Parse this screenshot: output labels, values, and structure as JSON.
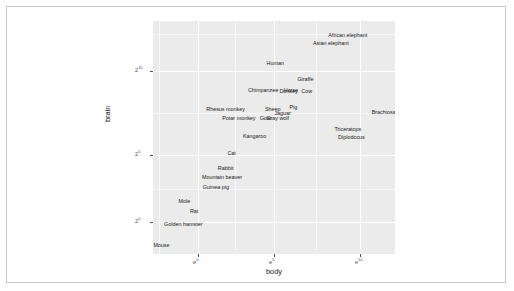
{
  "chart_data": {
    "type": "scatter",
    "title": "",
    "xlabel": "body",
    "ylabel": "brain",
    "x_scale": "log-e",
    "y_scale": "log-2",
    "grid": true,
    "legend": "none",
    "x_ticks": [
      {
        "label_base": "e",
        "label_exp": "0",
        "pos_pct": 18.6
      },
      {
        "label_base": "e",
        "label_exp": "5",
        "pos_pct": 50.0
      },
      {
        "label_base": "e",
        "label_exp": "10",
        "pos_pct": 85.5
      }
    ],
    "y_ticks": [
      {
        "label_base": "2",
        "label_exp": "10",
        "pos_pct": 21.5
      },
      {
        "label_base": "2",
        "label_exp": "5",
        "pos_pct": 57.5
      },
      {
        "label_base": "2",
        "label_exp": "0",
        "pos_pct": 86.3
      }
    ],
    "x_gridlines_major_pct": [
      18.6,
      50.0,
      85.5
    ],
    "y_gridlines_major_pct": [
      21.5,
      57.5,
      86.3
    ],
    "x_gridlines_minor_pct": [
      2.5,
      34.0,
      67.5
    ],
    "y_gridlines_minor_pct": [
      5.5,
      39.5,
      72.0
    ],
    "points": [
      {
        "name": "African elephant",
        "x_pct": 80.5,
        "y_pct": 6.5
      },
      {
        "name": "Asian elephant",
        "x_pct": 73.5,
        "y_pct": 10.0
      },
      {
        "name": "Human",
        "x_pct": 50.5,
        "y_pct": 18.5
      },
      {
        "name": "Giraffe",
        "x_pct": 63.0,
        "y_pct": 25.5
      },
      {
        "name": "Chimpanzee",
        "x_pct": 45.5,
        "y_pct": 30.0
      },
      {
        "name": "Horse",
        "x_pct": 57.0,
        "y_pct": 30.0
      },
      {
        "name": "Donkey",
        "x_pct": 56.0,
        "y_pct": 30.5
      },
      {
        "name": "Cow",
        "x_pct": 63.5,
        "y_pct": 30.3
      },
      {
        "name": "Rhesus monkey",
        "x_pct": 30.0,
        "y_pct": 38.0
      },
      {
        "name": "Sheep",
        "x_pct": 49.5,
        "y_pct": 38.0
      },
      {
        "name": "Pig",
        "x_pct": 58.0,
        "y_pct": 37.5
      },
      {
        "name": "Jaguar",
        "x_pct": 53.5,
        "y_pct": 39.8
      },
      {
        "name": "Potar monkey",
        "x_pct": 35.5,
        "y_pct": 42.0
      },
      {
        "name": "Goat",
        "x_pct": 46.5,
        "y_pct": 42.0
      },
      {
        "name": "Gray wolf",
        "x_pct": 51.5,
        "y_pct": 42.0
      },
      {
        "name": "Brachiosaurus",
        "x_pct": 97.5,
        "y_pct": 39.5
      },
      {
        "name": "Triceratops",
        "x_pct": 80.5,
        "y_pct": 46.8
      },
      {
        "name": "Diplodocus",
        "x_pct": 82.0,
        "y_pct": 50.2
      },
      {
        "name": "Kangaroo",
        "x_pct": 42.0,
        "y_pct": 49.8
      },
      {
        "name": "Cat",
        "x_pct": 32.5,
        "y_pct": 57.0
      },
      {
        "name": "Rabbit",
        "x_pct": 30.0,
        "y_pct": 63.5
      },
      {
        "name": "Mountain beaver",
        "x_pct": 28.5,
        "y_pct": 67.5
      },
      {
        "name": "Guinea pig",
        "x_pct": 26.0,
        "y_pct": 71.5
      },
      {
        "name": "Mole",
        "x_pct": 13.0,
        "y_pct": 77.8
      },
      {
        "name": "Rat",
        "x_pct": 17.0,
        "y_pct": 82.0
      },
      {
        "name": "Golden hamster",
        "x_pct": 12.5,
        "y_pct": 87.5
      },
      {
        "name": "Mouse",
        "x_pct": 3.5,
        "y_pct": 96.5
      }
    ]
  }
}
